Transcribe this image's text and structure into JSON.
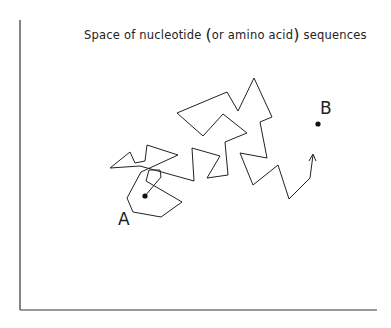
{
  "title": {
    "prefix": "Space of nucleotide ",
    "open_paren": "(",
    "middle": "or amino acid",
    "close_paren": ")",
    "suffix": " sequences"
  },
  "points": {
    "start": {
      "label": "A",
      "x": 145,
      "y": 196
    },
    "target": {
      "label": "B",
      "x": 318,
      "y": 124
    }
  },
  "axes": {
    "origin": [
      20,
      310
    ],
    "y_top": 20,
    "x_right": 377
  },
  "path": {
    "points": "145,196 161,177 160,170 149,170 146,181 182,202 161,217 133,212 127,198 141,172 178,155 147,145 145,161 135,163 130,152 110,168 140,166 194,181 192,148 220,156 207,178 228,175 225,142 247,133 223,114 203,136 177,113 227,92 238,111 254,78 272,117 260,122 267,158 240,153 253,185 278,165 289,199 310,178 313,155",
    "arrow_tip": [
      313,
      155
    ],
    "color": "#222222"
  }
}
